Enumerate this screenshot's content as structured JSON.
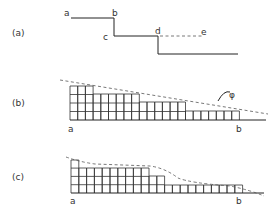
{
  "panels": [
    {
      "id": "a",
      "label": "(a)",
      "points": {
        "a": "a",
        "b": "b",
        "c": "c",
        "d": "d",
        "e": "e"
      }
    },
    {
      "id": "b",
      "label": "(b)",
      "endpoints": {
        "left": "a",
        "right": "b"
      },
      "angle_label": "φ",
      "grid": {
        "x0": 70,
        "base_y": 120,
        "col_w": 7.7,
        "row_h": 8.5,
        "steps": [
          {
            "cols": 3,
            "top": 86
          },
          {
            "cols": 6,
            "top": 94
          },
          {
            "cols": 6,
            "top": 102
          },
          {
            "cols": 7,
            "top": 111
          }
        ]
      }
    },
    {
      "id": "c",
      "label": "(c)",
      "endpoints": {
        "left": "a",
        "right": "b"
      },
      "grid": {
        "x0": 71,
        "base_y": 193,
        "col_w": 7.8,
        "row_h": 8.3,
        "steps": [
          {
            "cols": 1,
            "top": 160
          },
          {
            "cols": 9,
            "top": 168
          },
          {
            "cols": 2,
            "top": 176
          },
          {
            "cols": 10,
            "top": 185
          }
        ]
      }
    }
  ]
}
